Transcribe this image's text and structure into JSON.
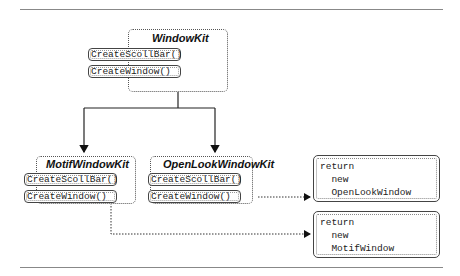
{
  "diagram": {
    "abstract_class": {
      "name": "WindowKit",
      "methods": [
        "CreateScollBar()",
        "CreateWindow()"
      ]
    },
    "subclasses": [
      {
        "name": "MotifWindowKit",
        "methods": [
          "CreateScollBar()",
          "CreateWindow()"
        ]
      },
      {
        "name": "OpenLookWindowKit",
        "methods": [
          "CreateScollBar()",
          "CreateWindow()"
        ]
      }
    ],
    "code_notes": [
      {
        "lines": [
          "return",
          "  new",
          "  OpenLookWindow"
        ]
      },
      {
        "lines": [
          "return",
          "  new",
          "  MotifWindow"
        ]
      }
    ],
    "colors": {
      "line": "#222222",
      "border": "#555555",
      "rule": "#888888"
    }
  }
}
